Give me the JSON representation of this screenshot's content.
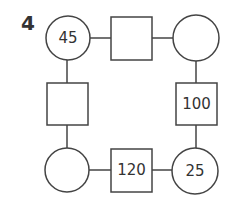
{
  "problem": {
    "number": "4"
  },
  "diagram": {
    "stroke_color": "#444444",
    "nodes": {
      "top_left_circle": {
        "value": "45"
      },
      "top_square": {
        "value": ""
      },
      "top_right_circle": {
        "value": ""
      },
      "left_square": {
        "value": ""
      },
      "right_square": {
        "value": "100"
      },
      "bottom_left_circle": {
        "value": ""
      },
      "bottom_square": {
        "value": "120"
      },
      "bottom_right_circle": {
        "value": "25"
      }
    }
  }
}
